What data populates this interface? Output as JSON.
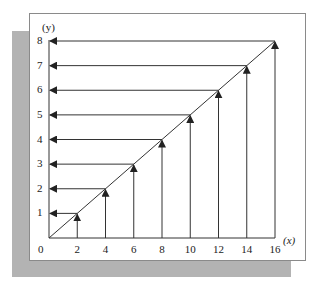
{
  "diagram": {
    "title": "",
    "x_axis_label": "(x)",
    "y_axis_label": "(y)",
    "origin_label": "0",
    "x_ticks": [
      "2",
      "4",
      "6",
      "8",
      "10",
      "12",
      "14",
      "16"
    ],
    "y_ticks": [
      "1",
      "2",
      "3",
      "4",
      "5",
      "6",
      "7",
      "8"
    ],
    "colors": {
      "line": "#333333",
      "shadow": "#b3b3b3",
      "frame_border": "#8a8a8a",
      "background": "#ffffff"
    }
  },
  "chart_data": {
    "type": "line",
    "title": "",
    "xlabel": "(x)",
    "ylabel": "(y)",
    "x": [
      0,
      2,
      4,
      6,
      8,
      10,
      12,
      14,
      16
    ],
    "series": [
      {
        "name": "y = x/2",
        "values": [
          0,
          1,
          2,
          3,
          4,
          5,
          6,
          7,
          8
        ]
      }
    ],
    "mapping_arrows": [
      {
        "x": 2,
        "y": 1
      },
      {
        "x": 4,
        "y": 2
      },
      {
        "x": 6,
        "y": 3
      },
      {
        "x": 8,
        "y": 4
      },
      {
        "x": 10,
        "y": 5
      },
      {
        "x": 12,
        "y": 6
      },
      {
        "x": 14,
        "y": 7
      },
      {
        "x": 16,
        "y": 8
      }
    ],
    "xlim": [
      0,
      16
    ],
    "ylim": [
      0,
      8
    ],
    "grid": false,
    "legend": "none"
  }
}
